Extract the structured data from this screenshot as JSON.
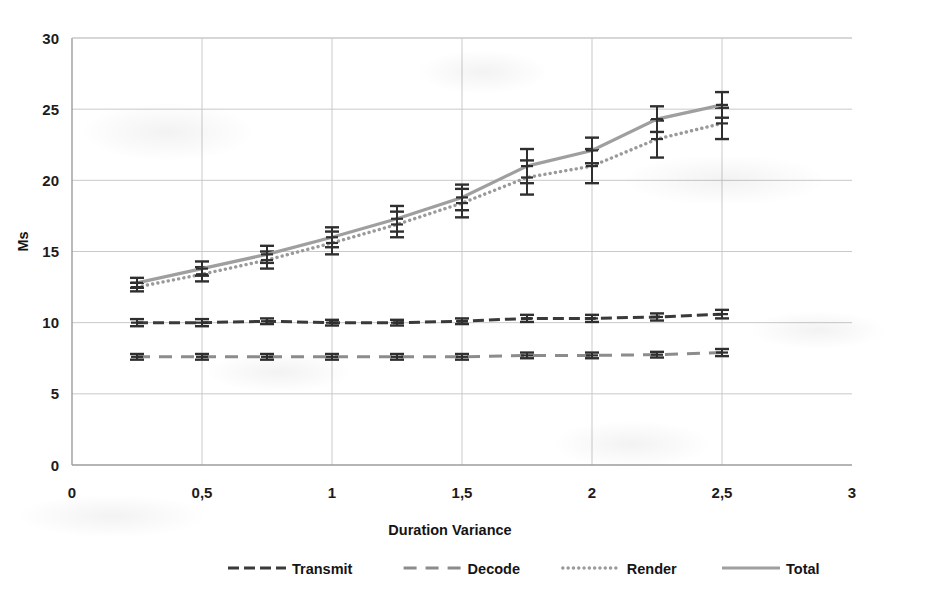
{
  "chart_data": {
    "type": "line",
    "title": "",
    "xlabel": "Duration Variance",
    "ylabel": "Ms",
    "xlim": [
      0,
      3
    ],
    "ylim": [
      0,
      30
    ],
    "x_ticks": [
      "0",
      "0,5",
      "1",
      "1,5",
      "2",
      "2,5",
      "3"
    ],
    "x_tick_values": [
      0,
      0.5,
      1,
      1.5,
      2,
      2.5,
      3
    ],
    "y_ticks": [
      "0",
      "5",
      "10",
      "15",
      "20",
      "25",
      "30"
    ],
    "y_tick_values": [
      0,
      5,
      10,
      15,
      20,
      25,
      30
    ],
    "grid": true,
    "legend_position": "bottom",
    "x": [
      0.25,
      0.5,
      0.75,
      1.0,
      1.25,
      1.5,
      1.75,
      2.0,
      2.25,
      2.5
    ],
    "series": [
      {
        "name": "Transmit",
        "style": "dash-dot",
        "color": "#3a3a3a",
        "values": [
          10.0,
          10.0,
          10.1,
          10.0,
          10.0,
          10.1,
          10.3,
          10.3,
          10.4,
          10.6
        ],
        "errors": [
          0.25,
          0.25,
          0.2,
          0.2,
          0.2,
          0.2,
          0.25,
          0.25,
          0.25,
          0.3
        ]
      },
      {
        "name": "Decode",
        "style": "dashed",
        "color": "#8c8c8c",
        "values": [
          7.6,
          7.6,
          7.6,
          7.6,
          7.6,
          7.6,
          7.7,
          7.7,
          7.75,
          7.9
        ],
        "errors": [
          0.2,
          0.2,
          0.2,
          0.2,
          0.2,
          0.2,
          0.2,
          0.2,
          0.2,
          0.25
        ]
      },
      {
        "name": "Render",
        "style": "dotted",
        "color": "#9a9a9a",
        "values": [
          12.5,
          13.4,
          14.4,
          15.6,
          16.9,
          18.4,
          20.2,
          21.0,
          22.9,
          24.0
        ],
        "errors": [
          0.3,
          0.5,
          0.6,
          0.8,
          0.9,
          1.0,
          1.2,
          1.2,
          1.3,
          1.1
        ]
      },
      {
        "name": "Total",
        "style": "solid",
        "color": "#9f9f9f",
        "values": [
          12.8,
          13.8,
          14.8,
          16.0,
          17.3,
          18.8,
          21.0,
          22.1,
          24.3,
          25.3
        ],
        "errors": [
          0.35,
          0.5,
          0.6,
          0.7,
          0.9,
          0.9,
          1.2,
          0.9,
          0.9,
          0.9
        ]
      }
    ]
  },
  "legend": {
    "items": [
      {
        "label": "Transmit"
      },
      {
        "label": "Decode"
      },
      {
        "label": "Render"
      },
      {
        "label": "Total"
      }
    ]
  }
}
